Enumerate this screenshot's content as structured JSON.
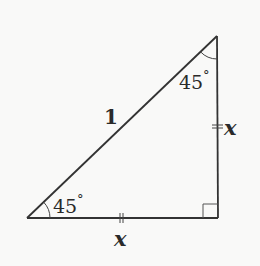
{
  "diagram": {
    "colors": {
      "stroke": "#333333",
      "text": "#2a2a2a",
      "background": "#f9f9f8"
    },
    "vertices": {
      "bottom_left": [
        27,
        218
      ],
      "bottom_right": [
        218,
        218
      ],
      "top_right": [
        217,
        36
      ]
    },
    "labels": {
      "hypotenuse": "1",
      "bottom_side": "x",
      "right_side": "x",
      "angle_bottom_left": "45",
      "angle_top_right": "45",
      "degree_symbol": "°"
    },
    "markers": {
      "right_angle": "square-at-bottom-right",
      "equal_ticks": "double-tick on both legs"
    }
  }
}
